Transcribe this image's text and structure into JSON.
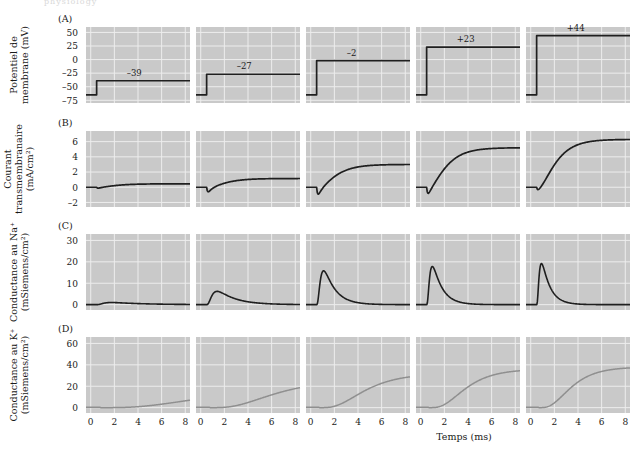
{
  "figure": {
    "ghost_header": "physiology",
    "x_axis_title": "Temps (ms)",
    "x_ticks": [
      0,
      2,
      4,
      6,
      8
    ],
    "panels": [
      {
        "letter": "(A)",
        "axis_title_lines": [
          "Potentiel de",
          "membrane (mV)"
        ],
        "y_ticks": [
          50,
          25,
          0,
          -25,
          -50,
          -75
        ],
        "y_tick_labels": [
          "50",
          "25",
          "0",
          "–25",
          "–50",
          "–75"
        ],
        "ylim": [
          -80,
          60
        ],
        "grid_y": [
          50,
          25,
          0,
          -25,
          -50,
          -75
        ],
        "rest_value": -65,
        "columns": [
          {
            "label": "–39",
            "value": -39
          },
          {
            "label": "–27",
            "value": -27
          },
          {
            "label": "–2",
            "value": -2
          },
          {
            "label": "+23",
            "value": 23
          },
          {
            "label": "+44",
            "value": 44
          }
        ]
      },
      {
        "letter": "(B)",
        "axis_title_lines": [
          "Courant",
          "transmembranaire",
          "(mA/cm²)"
        ],
        "y_ticks": [
          6,
          4,
          2,
          0,
          -2
        ],
        "y_tick_labels": [
          "6",
          "4",
          "2",
          "0",
          "–2"
        ],
        "ylim": [
          -2.6,
          7.4
        ],
        "grid_y": [
          6,
          4,
          2,
          0,
          -2
        ],
        "columns": [
          {
            "dip": -0.12,
            "plateau": 0.45
          },
          {
            "dip": -0.62,
            "plateau": 1.15
          },
          {
            "dip": -0.95,
            "plateau": 3.0
          },
          {
            "dip": -0.85,
            "plateau": 5.2
          },
          {
            "dip": -0.35,
            "plateau": 6.3
          }
        ]
      },
      {
        "letter": "(C)",
        "axis_title_lines": [
          "Conductance au Na⁺",
          "(mSiemens/cm²)"
        ],
        "y_ticks": [
          30,
          20,
          10,
          0
        ],
        "y_tick_labels": [
          "30",
          "20",
          "10",
          "0"
        ],
        "ylim": [
          -2.5,
          33
        ],
        "grid_y": [
          30,
          20,
          10,
          0
        ],
        "columns": [
          {
            "peak": 1.0,
            "peak_time": 1.4,
            "decay": 2.6
          },
          {
            "peak": 6.2,
            "peak_time": 1.1,
            "decay": 1.5
          },
          {
            "peak": 15.8,
            "peak_time": 0.75,
            "decay": 0.95
          },
          {
            "peak": 17.8,
            "peak_time": 0.6,
            "decay": 0.8
          },
          {
            "peak": 19.2,
            "peak_time": 0.5,
            "decay": 0.7
          }
        ]
      },
      {
        "letter": "(D)",
        "axis_title_lines": [
          "Conductance au K⁺",
          "(mSiemens/cm²)"
        ],
        "y_ticks": [
          60,
          40,
          20,
          0
        ],
        "y_tick_labels": [
          "60",
          "40",
          "20",
          "0"
        ],
        "ylim": [
          -5,
          66
        ],
        "grid_y": [
          60,
          40,
          20,
          0
        ],
        "columns": [
          {
            "plateau": 19,
            "tau": 5.0,
            "delay": 0.35
          },
          {
            "plateau": 26,
            "tau": 3.0,
            "delay": 0.3
          },
          {
            "plateau": 32,
            "tau": 2.1,
            "delay": 0.25
          },
          {
            "plateau": 36,
            "tau": 1.7,
            "delay": 0.2
          },
          {
            "plateau": 38,
            "tau": 1.5,
            "delay": 0.18
          }
        ]
      }
    ]
  },
  "chart_data": {
    "type": "line",
    "title": "",
    "xlabel": "Temps (ms)",
    "xlim": [
      -0.4,
      8.4
    ],
    "x_ticks": [
      0,
      2,
      4,
      6,
      8
    ],
    "grid": true,
    "legend": "none",
    "columns": 5,
    "panels": [
      {
        "id": "A",
        "ylabel": "Potentiel de membrane (mV)",
        "ylim": [
          -80,
          60
        ],
        "y_ticks": [
          50,
          25,
          0,
          -25,
          -50,
          -75
        ],
        "description": "Depolarizing voltage-clamp steps from a resting level of -65 mV to five command potentials; step occurs at t = 0.5 ms.",
        "series": [
          {
            "name": "-39 mV step",
            "annotation": "–39",
            "baseline": -65,
            "step_to": -39
          },
          {
            "name": "-27 mV step",
            "annotation": "–27",
            "baseline": -65,
            "step_to": -27
          },
          {
            "name": "-2 mV step",
            "annotation": "–2",
            "baseline": -65,
            "step_to": -2
          },
          {
            "name": "+23 mV step",
            "annotation": "+23",
            "baseline": -65,
            "step_to": 23
          },
          {
            "name": "+44 mV step",
            "annotation": "+44",
            "baseline": -65,
            "step_to": 44
          }
        ]
      },
      {
        "id": "B",
        "ylabel": "Courant transmembranaire (mA/cm2)",
        "ylim": [
          -2.6,
          7.4
        ],
        "y_ticks": [
          6,
          4,
          2,
          0,
          -2
        ],
        "description": "Membrane current: early transient inward (negative) component followed by sustained outward (positive) component.",
        "series": [
          {
            "name": "-39 mV",
            "inward_peak": -0.12,
            "outward_plateau": 0.45
          },
          {
            "name": "-27 mV",
            "inward_peak": -0.62,
            "outward_plateau": 1.15
          },
          {
            "name": "-2 mV",
            "inward_peak": -0.95,
            "outward_plateau": 3.0
          },
          {
            "name": "+23 mV",
            "inward_peak": -0.85,
            "outward_plateau": 5.2
          },
          {
            "name": "+44 mV",
            "inward_peak": -0.35,
            "outward_plateau": 6.3
          }
        ]
      },
      {
        "id": "C",
        "ylabel": "Conductance au Na+ (mSiemens/cm2)",
        "ylim": [
          -2.5,
          33
        ],
        "y_ticks": [
          30,
          20,
          10,
          0
        ],
        "description": "Sodium conductance: transient peak that rises and inactivates faster and larger with stronger depolarization.",
        "series": [
          {
            "name": "-39 mV",
            "peak": 1.0,
            "time_to_peak_ms": 1.4
          },
          {
            "name": "-27 mV",
            "peak": 6.2,
            "time_to_peak_ms": 1.1
          },
          {
            "name": "-2 mV",
            "peak": 15.8,
            "time_to_peak_ms": 0.75
          },
          {
            "name": "+23 mV",
            "peak": 17.8,
            "time_to_peak_ms": 0.6
          },
          {
            "name": "+44 mV",
            "peak": 19.2,
            "time_to_peak_ms": 0.5
          }
        ]
      },
      {
        "id": "D",
        "ylabel": "Conductance au K+ (mSiemens/cm2)",
        "ylim": [
          -5,
          66
        ],
        "y_ticks": [
          60,
          40,
          20,
          0
        ],
        "description": "Potassium conductance: delayed sigmoidal rise to a maintained plateau that grows with depolarization.",
        "series": [
          {
            "name": "-39 mV",
            "plateau": 19,
            "rise_tau_ms": 5.0
          },
          {
            "name": "-27 mV",
            "plateau": 26,
            "rise_tau_ms": 3.0
          },
          {
            "name": "-2 mV",
            "plateau": 32,
            "rise_tau_ms": 2.1
          },
          {
            "name": "+23 mV",
            "plateau": 36,
            "rise_tau_ms": 1.7
          },
          {
            "name": "+44 mV",
            "plateau": 38,
            "rise_tau_ms": 1.5
          }
        ]
      }
    ]
  },
  "colors": {
    "panel_background": "#c9c9c9",
    "gridline": "#ededed",
    "trace_dark": "#1f1f1f",
    "trace_light": "#8f8f8f",
    "text": "#1a1a1a"
  }
}
